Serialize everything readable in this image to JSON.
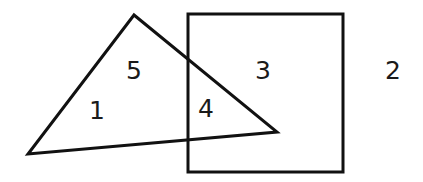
{
  "diagram": {
    "shapes": {
      "triangle": {
        "points": "134,15 28,154 277,132",
        "stroke": "#111111"
      },
      "square": {
        "x": 188,
        "y": 14,
        "width": 155,
        "height": 158,
        "stroke": "#111111"
      }
    },
    "regions": [
      {
        "label": "1",
        "x": 97,
        "y": 110
      },
      {
        "label": "5",
        "x": 134,
        "y": 70
      },
      {
        "label": "4",
        "x": 206,
        "y": 108
      },
      {
        "label": "3",
        "x": 263,
        "y": 70
      },
      {
        "label": "2",
        "x": 393,
        "y": 70
      }
    ]
  }
}
